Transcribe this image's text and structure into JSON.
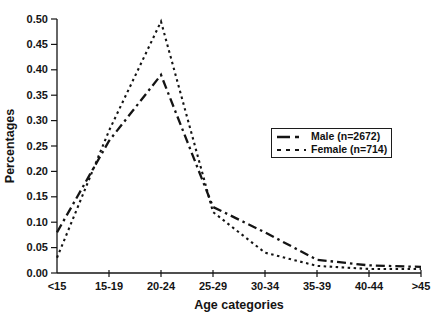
{
  "chart_data": {
    "type": "line",
    "title": "",
    "xlabel": "Age categories",
    "ylabel": "Percentages",
    "categories": [
      "<15",
      "15-19",
      "20-24",
      "25-29",
      "30-34",
      "35-39",
      "40-44",
      ">45"
    ],
    "series": [
      {
        "id": "male",
        "name": "Male (n=2672)",
        "values": [
          0.08,
          0.26,
          0.39,
          0.13,
          0.08,
          0.026,
          0.015,
          0.012
        ],
        "dash": "9 4 2.5 4",
        "legend_dash": "13 5 4 9",
        "width": 2.3
      },
      {
        "id": "female",
        "name": "Female (n=714)",
        "values": [
          0.03,
          0.28,
          0.495,
          0.12,
          0.04,
          0.014,
          0.008,
          0.008
        ],
        "dash": "2.5 3.5",
        "legend_dash": "4 5",
        "width": 2.1
      }
    ],
    "ylim": [
      0,
      0.5
    ],
    "ytick_step": 0.05,
    "ytick_labels": [
      "0.00",
      "0.05",
      "0.10",
      "0.15",
      "0.20",
      "0.25",
      "0.30",
      "0.35",
      "0.40",
      "0.45",
      "0.50"
    ],
    "grid": false,
    "legend_position": "middle-right",
    "line_color": "#141414"
  }
}
